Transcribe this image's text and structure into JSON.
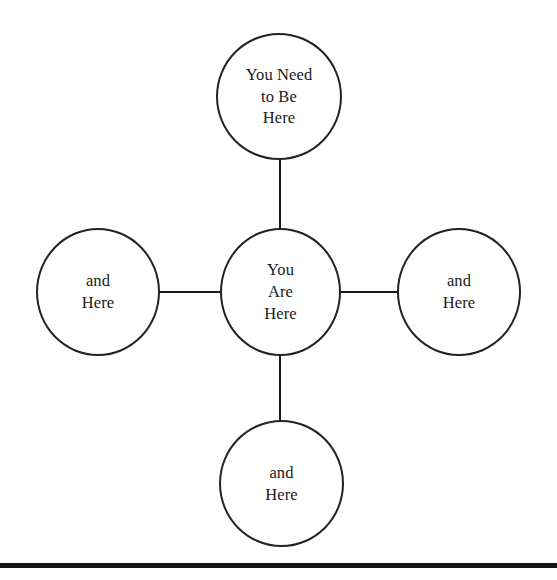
{
  "diagram": {
    "type": "node-cross-diagram",
    "background_color": "#ffffff",
    "stroke_color": "#232323",
    "text_color": "#1a1a1a",
    "nodes": {
      "center": {
        "id": "you-are-here",
        "label": "You\nAre\nHere",
        "position": "center"
      },
      "top": {
        "id": "you-need-to-be-here",
        "label": "You Need\nto Be\nHere",
        "position": "top"
      },
      "left": {
        "id": "and-here-left",
        "label": "and\nHere",
        "position": "left"
      },
      "right": {
        "id": "and-here-right",
        "label": "and\nHere",
        "position": "right"
      },
      "bottom": {
        "id": "and-here-bottom",
        "label": "and\nHere",
        "position": "bottom"
      }
    },
    "connectors": [
      {
        "from": "center",
        "to": "top",
        "orientation": "vertical"
      },
      {
        "from": "center",
        "to": "bottom",
        "orientation": "vertical"
      },
      {
        "from": "center",
        "to": "left",
        "orientation": "horizontal"
      },
      {
        "from": "center",
        "to": "right",
        "orientation": "horizontal"
      }
    ],
    "footer_rule": {
      "color": "#151515",
      "thickness_px": 5
    }
  }
}
